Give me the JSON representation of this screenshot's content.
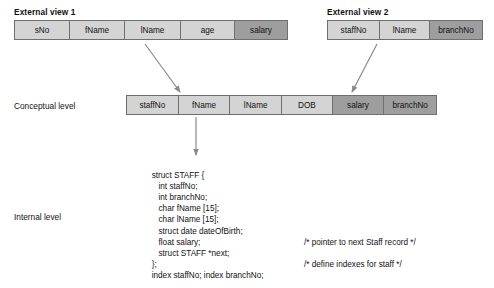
{
  "diagram": {
    "title_hidden": "ANSI-SPARC three-level architecture",
    "external_views": [
      {
        "caption": "External view 1",
        "columns": [
          {
            "label": "sNo",
            "shaded": false
          },
          {
            "label": "fName",
            "shaded": false
          },
          {
            "label": "lName",
            "shaded": false
          },
          {
            "label": "age",
            "shaded": false
          },
          {
            "label": "salary",
            "shaded": true
          }
        ]
      },
      {
        "caption": "External view 2",
        "columns": [
          {
            "label": "staffNo",
            "shaded": false
          },
          {
            "label": "lName",
            "shaded": false
          },
          {
            "label": "branchNo",
            "shaded": true
          }
        ]
      }
    ],
    "conceptual": {
      "label": "Conceptual level",
      "columns": [
        {
          "label": "staffNo",
          "shaded": false
        },
        {
          "label": "fName",
          "shaded": false
        },
        {
          "label": "lName",
          "shaded": false
        },
        {
          "label": "DOB",
          "shaded": false
        },
        {
          "label": "salary",
          "shaded": true
        },
        {
          "label": "branchNo",
          "shaded": true
        }
      ]
    },
    "internal": {
      "label": "Internal level",
      "code_lines": [
        {
          "text": "struct STAFF {",
          "comment": ""
        },
        {
          "text": "   int staffNo;",
          "comment": ""
        },
        {
          "text": "   int branchNo;",
          "comment": ""
        },
        {
          "text": "   char fName [15];",
          "comment": ""
        },
        {
          "text": "   char lName [15];",
          "comment": ""
        },
        {
          "text": "   struct date dateOfBirth;",
          "comment": ""
        },
        {
          "text": "   float salary;",
          "comment": ""
        },
        {
          "text": "   struct STAFF *next;",
          "comment": "/* pointer to next Staff record */"
        },
        {
          "text": "};",
          "comment": ""
        },
        {
          "text": "index staffNo; index branchNo;",
          "comment": "/* define indexes for staff */"
        }
      ]
    },
    "colors": {
      "cell_light": "#d4d4d4",
      "cell_dark": "#9e9e9e",
      "border": "#6f6f6f",
      "arrow": "#8a8a8a",
      "text": "#111111"
    }
  }
}
